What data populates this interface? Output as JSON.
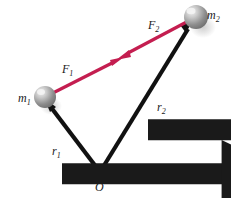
{
  "figure": {
    "name": "gravitational-force-pair-vector-diagram",
    "background_color": "#ffffff",
    "width": 231,
    "height": 198
  },
  "colors": {
    "force_vector": "#c41e50",
    "position_vector": "#111111",
    "sphere_body": "#9a9a9a",
    "sphere_highlight": "#e8e8e8",
    "sphere_shadow": "#cfcfcf",
    "label_text": "#1a1a1a"
  },
  "labels": {
    "mass_1": {
      "symbol": "m",
      "subscript": "1",
      "x": 18,
      "y": 89
    },
    "mass_2": {
      "symbol": "m",
      "subscript": "2",
      "x": 207,
      "y": 6
    },
    "origin": {
      "symbol": "O",
      "x": 95,
      "y": 178
    },
    "force_1": {
      "symbol": "F",
      "subscript": "1",
      "x": 62,
      "y": 60,
      "accent": "vector-arrow"
    },
    "force_2": {
      "symbol": "F",
      "subscript": "2",
      "x": 148,
      "y": 16,
      "accent": "vector-arrow"
    },
    "radius_1": {
      "symbol": "r",
      "subscript": "1",
      "x": 52,
      "y": 142,
      "accent": "vector-arrow"
    },
    "radius_2": {
      "symbol": "r",
      "subscript": "2",
      "x": 157,
      "y": 98,
      "accent": "vector-arrow"
    }
  },
  "spheres": [
    {
      "name": "mass-1-sphere",
      "cx": 45,
      "cy": 97,
      "r": 11
    },
    {
      "name": "mass-2-sphere",
      "cx": 196,
      "cy": 17,
      "r": 12
    }
  ],
  "vectors": [
    {
      "name": "force-on-mass-1",
      "label": "F1",
      "color": "#c41e50",
      "from": {
        "x": 45,
        "y": 97
      },
      "to": {
        "x": 122,
        "y": 58
      },
      "arrowhead": "at-tip",
      "description": "Force on m1 pointing toward m2"
    },
    {
      "name": "force-on-mass-2",
      "label": "F2",
      "color": "#c41e50",
      "from": {
        "x": 196,
        "y": 17
      },
      "to": {
        "x": 118,
        "y": 60
      },
      "arrowhead": "at-tip",
      "description": "Force on m2 pointing toward m1"
    },
    {
      "name": "position-vector-mass-1",
      "label": "r1",
      "color": "#111111",
      "from": {
        "x": 100,
        "y": 172
      },
      "to": {
        "x": 45,
        "y": 100
      },
      "arrowhead": "at-tip",
      "description": "Position vector from origin O to m1"
    },
    {
      "name": "position-vector-mass-2",
      "label": "r2",
      "color": "#111111",
      "from": {
        "x": 100,
        "y": 172
      },
      "to": {
        "x": 192,
        "y": 22
      },
      "arrowhead": "at-tip",
      "description": "Position vector from origin O to m2"
    }
  ]
}
